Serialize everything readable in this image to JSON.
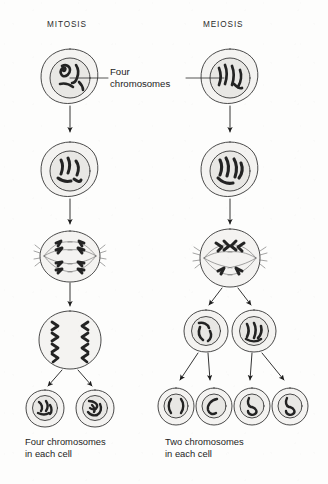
{
  "figure": {
    "background_color": "#fdfdfc",
    "ink_color": "#1d1d1d",
    "cell_fill": "#f4f3f1",
    "nucleus_fill": "#e7e6e3"
  },
  "columns": {
    "mitosis": {
      "title": "MITOSIS",
      "caption_line1": "Four chromosomes",
      "caption_line2": "in each cell",
      "stage_count": 5,
      "daughter_cell_count": 2,
      "chromosomes_per_daughter_cell": 4
    },
    "meiosis": {
      "title": "MEIOSIS",
      "caption_line1": "Two chromosomes",
      "caption_line2": "in each cell",
      "stage_count": 6,
      "daughter_cell_count": 4,
      "chromosomes_per_daughter_cell": 2
    }
  },
  "callout": {
    "line1": "Four",
    "line2": "chromosomes"
  },
  "icons": {
    "cell": "cell-icon",
    "nucleus": "nucleus-icon",
    "chromosome": "chromosome-icon",
    "spindle": "spindle-icon",
    "arrow": "arrow-down-icon",
    "leader_line": "leader-line-icon"
  }
}
